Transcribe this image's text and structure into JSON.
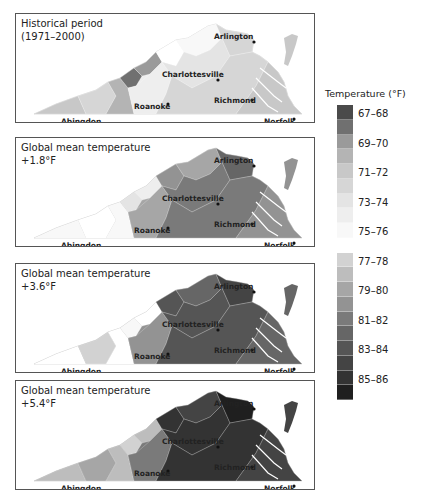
{
  "legend": {
    "title": "Temperature (°F)",
    "labels": [
      "67–68",
      "69–70",
      "71–72",
      "73–74",
      "75–76",
      "77–78",
      "79–80",
      "81–82",
      "83–84",
      "85–86"
    ],
    "colors": [
      "#4a4a4a",
      "#707070",
      "#9a9a9a",
      "#b4b4b4",
      "#c8c8c8",
      "#d6d6d6",
      "#e4e4e4",
      "#eeeeee",
      "#f8f8f8",
      "#ffffff",
      "#d2d2d2",
      "#bdbdbd",
      "#a6a6a6",
      "#939393",
      "#7a7a7a",
      "#666666",
      "#555555",
      "#444444",
      "#333333",
      "#1f1f1f"
    ]
  },
  "panels": [
    {
      "title_line1": "Historical period",
      "title_line2": "(1971–2000)",
      "zones": [
        4,
        5,
        3,
        1,
        2,
        7,
        9,
        8,
        6,
        5,
        5,
        4
      ]
    },
    {
      "title_line1": "Global mean temperature",
      "title_line2": "+1.8°F",
      "zones": [
        8,
        9,
        8,
        6,
        7,
        12,
        13,
        12,
        14,
        15,
        14,
        13
      ]
    },
    {
      "title_line1": "Global mean temperature",
      "title_line2": "+3.6°F",
      "zones": [
        9,
        10,
        9,
        8,
        9,
        13,
        16,
        15,
        16,
        17,
        16,
        15
      ]
    },
    {
      "title_line1": "Global mean temperature",
      "title_line2": "+5.4°F",
      "zones": [
        11,
        12,
        11,
        10,
        11,
        14,
        18,
        17,
        18,
        19,
        18,
        17
      ]
    }
  ],
  "cities": [
    {
      "name": "Arlington"
    },
    {
      "name": "Charlottesville"
    },
    {
      "name": "Richmond"
    },
    {
      "name": "Roanoke"
    },
    {
      "name": "Abingdon"
    },
    {
      "name": "Norfolk"
    }
  ]
}
